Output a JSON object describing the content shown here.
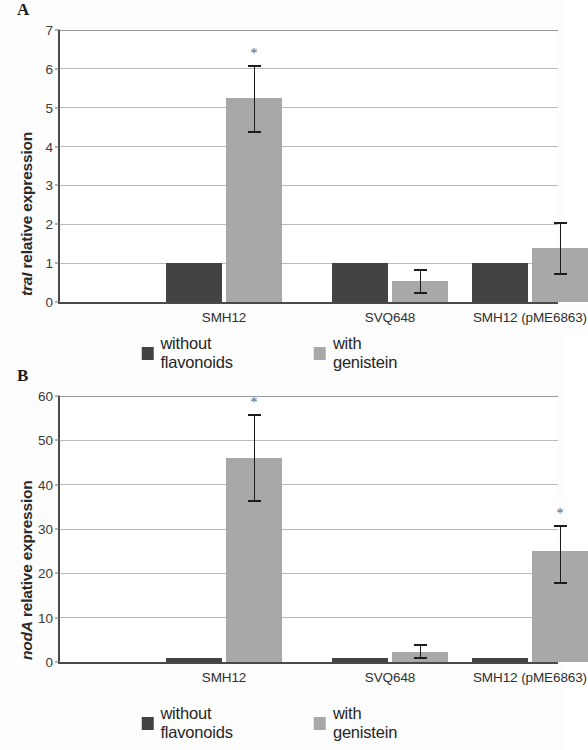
{
  "figure": {
    "panels": [
      {
        "letter": "A",
        "gene": "traI",
        "ylabel_suffix": " relative expression"
      },
      {
        "letter": "B",
        "gene": "nodA",
        "ylabel_suffix": " relative expression"
      }
    ],
    "legend": {
      "items": [
        {
          "label": "without flavonoids",
          "color": "#434343",
          "key": "without-flavonoids"
        },
        {
          "label": "with genistein",
          "color": "#a8a8a8",
          "key": "with-genistein"
        }
      ]
    },
    "significance_marker": "*"
  },
  "chart_data": [
    {
      "panel": "A",
      "type": "bar",
      "title": "",
      "xlabel": "",
      "ylabel": "traI relative expression",
      "ylim": [
        0,
        7
      ],
      "yticks": [
        0,
        1,
        2,
        3,
        4,
        5,
        6,
        7
      ],
      "ytick_labels": [
        "0",
        "1",
        "2",
        "3",
        "4",
        "5",
        "6",
        "7"
      ],
      "grid": true,
      "legend_position": "below",
      "categories": [
        "SMH12",
        "SVQ648",
        "SMH12 (pME6863)"
      ],
      "series": [
        {
          "name": "without flavonoids",
          "color": "#434343",
          "values": [
            1.0,
            1.0,
            1.0
          ],
          "errors_low": [
            null,
            null,
            null
          ],
          "errors_high": [
            null,
            null,
            null
          ],
          "significant": [
            false,
            false,
            false
          ]
        },
        {
          "name": "with genistein",
          "color": "#a8a8a8",
          "values": [
            5.25,
            0.55,
            1.4
          ],
          "errors_low": [
            4.35,
            0.2,
            0.7
          ],
          "errors_high": [
            6.1,
            0.85,
            2.05
          ],
          "significant": [
            true,
            false,
            false
          ]
        }
      ]
    },
    {
      "panel": "B",
      "type": "bar",
      "title": "",
      "xlabel": "",
      "ylabel": "nodA relative expression",
      "ylim": [
        0,
        60
      ],
      "yticks": [
        0,
        10,
        20,
        30,
        40,
        50,
        60
      ],
      "ytick_labels": [
        "0",
        "10",
        "20",
        "30",
        "40",
        "50",
        "60"
      ],
      "grid": true,
      "legend_position": "below",
      "categories": [
        "SMH12",
        "SVQ648",
        "SMH12 (pME6863)"
      ],
      "series": [
        {
          "name": "without flavonoids",
          "color": "#434343",
          "values": [
            1.0,
            1.0,
            1.0
          ],
          "errors_low": [
            null,
            null,
            null
          ],
          "errors_high": [
            null,
            null,
            null
          ],
          "significant": [
            false,
            false,
            false
          ]
        },
        {
          "name": "with genistein",
          "color": "#a8a8a8",
          "values": [
            46.0,
            2.3,
            25.0
          ],
          "errors_low": [
            36.0,
            0.7,
            17.5
          ],
          "errors_high": [
            56.0,
            4.0,
            31.0
          ],
          "significant": [
            true,
            false,
            true
          ]
        }
      ]
    }
  ]
}
